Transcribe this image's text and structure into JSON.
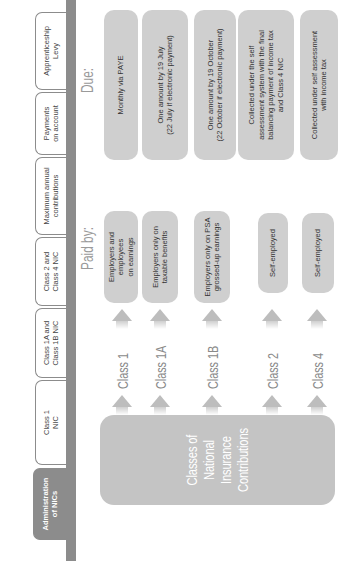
{
  "tabs": [
    {
      "label": "Administration\nof NICs",
      "active": true
    },
    {
      "label": "Class 1\nNIC",
      "active": false
    },
    {
      "label": "Class 1A and\nClass 1B NIC",
      "active": false
    },
    {
      "label": "Class 2 and\nClass 4 NIC",
      "active": false
    },
    {
      "label": "Maximum annual\ncontributions",
      "active": false
    },
    {
      "label": "Payments\non account",
      "active": false
    },
    {
      "label": "Apprenticeship\nLevy",
      "active": false
    }
  ],
  "central_box": "Classes of\nNational\nInsurance\nContributions",
  "headers": {
    "paid_by": "Paid by:",
    "due": "Due:"
  },
  "rows": [
    {
      "class": "Class 1",
      "paid_by": "Employers and employees\non earnings",
      "due": "Monthly via PAYE"
    },
    {
      "class": "Class 1A",
      "paid_by": "Employers only on\ntaxable benefits",
      "due": "One amount by 19 July\n(22 July if electronic payment)"
    },
    {
      "class": "Class 1B",
      "paid_by": "Employers only on PSA\ngrossed-up earnings",
      "due": "One amount by 19 October\n(22 October if electronic payment)"
    },
    {
      "class": "Class 2",
      "paid_by": "Self-employed",
      "due": "Collected under the self\nassessment system with the final\nbalancing payment of income tax\nand Class 4 NIC"
    },
    {
      "class": "Class 4",
      "paid_by": "Self-employed",
      "due": "Collected under self assessment\nwith income tax"
    }
  ],
  "colors": {
    "tab_strip": "#8c8c8c",
    "box_fill": "#cfcfcf",
    "central_box": "#c4c4c4",
    "class_text": "#8a8a8a"
  }
}
